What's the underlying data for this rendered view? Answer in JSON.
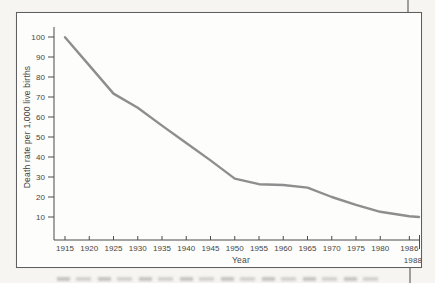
{
  "chart_data": {
    "type": "line",
    "title": "",
    "xlabel": "Year",
    "ylabel": "Death rate per 1,000 live births",
    "x": [
      1915,
      1920,
      1925,
      1930,
      1935,
      1940,
      1945,
      1950,
      1955,
      1960,
      1965,
      1970,
      1975,
      1980,
      1986,
      1988
    ],
    "values": [
      99.9,
      85.8,
      71.7,
      64.6,
      55.7,
      47.0,
      38.3,
      29.2,
      26.4,
      26.0,
      24.7,
      20.0,
      16.1,
      12.6,
      10.4,
      10.0
    ],
    "x_ticks": [
      1915,
      1920,
      1925,
      1930,
      1935,
      1940,
      1945,
      1950,
      1955,
      1960,
      1965,
      1970,
      1975,
      1980,
      1986
    ],
    "x_axis_end_tick_label": "1988",
    "y_ticks": [
      10,
      20,
      30,
      40,
      50,
      60,
      70,
      80,
      90,
      100
    ],
    "ylim": [
      0,
      105
    ],
    "xlim": [
      1913,
      1988
    ],
    "grid": false,
    "legend": false,
    "line_color": "#8e8e8e",
    "axis_color": "#4a4a4a",
    "text_color": "#454545"
  }
}
